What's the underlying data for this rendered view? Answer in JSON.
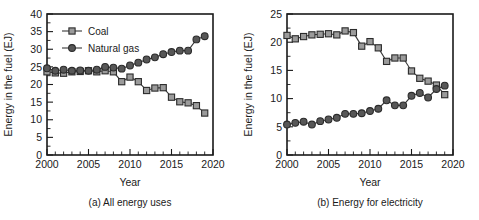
{
  "figure": {
    "panels": [
      {
        "id": "panel-a",
        "caption": "(a) All energy uses",
        "chart_data": {
          "type": "line",
          "title": "",
          "xlabel": "Year",
          "ylabel": "Energy in the fuel (EJ)",
          "xlim": [
            2000,
            2020
          ],
          "ylim": [
            0,
            40
          ],
          "xticks": [
            2000,
            2005,
            2010,
            2015,
            2020
          ],
          "yticks": [
            0,
            5,
            10,
            15,
            20,
            25,
            30,
            35,
            40
          ],
          "xtick_labels": [
            "2000",
            "2005",
            "2010",
            "2015",
            "2020"
          ],
          "ytick_labels": [
            "0",
            "5",
            "10",
            "15",
            "20",
            "25",
            "30",
            "35",
            "40"
          ],
          "minor_xtick_step": 1,
          "grid": false,
          "legend_position": "upper-left",
          "x": [
            2000,
            2001,
            2002,
            2003,
            2004,
            2005,
            2006,
            2007,
            2008,
            2009,
            2010,
            2011,
            2012,
            2013,
            2014,
            2015,
            2016,
            2017,
            2018,
            2019
          ],
          "series": [
            {
              "name": "Coal",
              "marker": "square",
              "color": "#9b9b9b",
              "values": [
                23.6,
                23.3,
                23.2,
                23.6,
                23.7,
                23.9,
                23.6,
                23.9,
                23.6,
                20.8,
                22.1,
                20.8,
                18.3,
                19.0,
                19.1,
                16.4,
                15.1,
                14.8,
                14.0,
                11.9
              ]
            },
            {
              "name": "Natural gas",
              "marker": "circle",
              "color": "#575757",
              "values": [
                24.6,
                23.9,
                24.2,
                23.9,
                24.0,
                23.9,
                24.2,
                25.0,
                24.8,
                24.5,
                25.4,
                26.2,
                27.1,
                27.7,
                28.6,
                29.2,
                29.6,
                29.6,
                32.8,
                33.7
              ]
            }
          ]
        }
      },
      {
        "id": "panel-b",
        "caption": "(b) Energy for electricity",
        "chart_data": {
          "type": "line",
          "title": "",
          "xlabel": "Year",
          "ylabel": "Energy in the fuel (EJ)",
          "xlim": [
            2000,
            2020
          ],
          "ylim": [
            0,
            25
          ],
          "xticks": [
            2000,
            2005,
            2010,
            2015,
            2020
          ],
          "yticks": [
            0,
            5,
            10,
            15,
            20,
            25
          ],
          "xtick_labels": [
            "2000",
            "2005",
            "2010",
            "2015",
            "2020"
          ],
          "ytick_labels": [
            "0",
            "5",
            "10",
            "15",
            "20",
            "25"
          ],
          "minor_xtick_step": 1,
          "grid": false,
          "legend_position": "none",
          "x": [
            2000,
            2001,
            2002,
            2003,
            2004,
            2005,
            2006,
            2007,
            2008,
            2009,
            2010,
            2011,
            2012,
            2013,
            2014,
            2015,
            2016,
            2017,
            2018,
            2019
          ],
          "series": [
            {
              "name": "Coal",
              "marker": "square",
              "color": "#9b9b9b",
              "values": [
                21.2,
                20.6,
                21.0,
                21.3,
                21.4,
                21.5,
                21.3,
                22.0,
                21.7,
                19.3,
                20.1,
                19.0,
                16.6,
                17.2,
                17.2,
                14.9,
                13.6,
                13.1,
                12.4,
                10.7
              ]
            },
            {
              "name": "Natural gas",
              "marker": "circle",
              "color": "#575757",
              "values": [
                5.4,
                5.7,
                5.9,
                5.4,
                6.0,
                6.3,
                6.6,
                7.3,
                7.3,
                7.4,
                7.8,
                8.2,
                9.7,
                8.8,
                8.8,
                10.5,
                11.0,
                10.2,
                11.7,
                12.3
              ]
            }
          ]
        }
      }
    ],
    "legend": {
      "items": [
        {
          "label": "Coal",
          "marker": "square",
          "color": "#9b9b9b"
        },
        {
          "label": "Natural gas",
          "marker": "circle",
          "color": "#575757"
        }
      ]
    }
  }
}
